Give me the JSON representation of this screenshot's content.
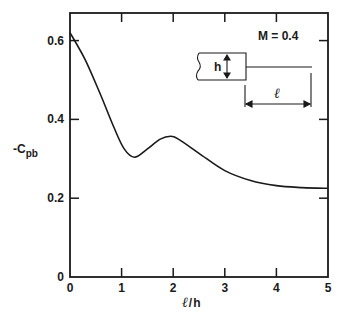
{
  "chart_data": {
    "type": "line",
    "title": "",
    "xlabel": "ℓ/h",
    "ylabel": "-C_pb",
    "ylabel_main": "-C",
    "ylabel_sub": "pb",
    "xlim": [
      0,
      5
    ],
    "ylim": [
      0,
      0.67
    ],
    "x_ticks": [
      0,
      1,
      2,
      3,
      4,
      5
    ],
    "x_tick_labels": [
      "0",
      "1",
      "2",
      "3",
      "4",
      "5"
    ],
    "y_ticks": [
      0,
      0.2,
      0.4,
      0.6
    ],
    "y_tick_labels": [
      "0",
      "0.2",
      "0.4",
      "0.6"
    ],
    "grid": false,
    "legend": null,
    "annotations": [
      "M = 0.4"
    ],
    "inset": {
      "description": "bluff body of height h with splitter plate of length ℓ",
      "height_label": "h",
      "length_label": "ℓ"
    },
    "series": [
      {
        "name": "M = 0.4",
        "x": [
          0,
          0.3,
          0.6,
          0.85,
          1.05,
          1.25,
          1.5,
          1.75,
          1.95,
          2.1,
          2.5,
          3.0,
          3.5,
          4.0,
          4.5,
          5.0
        ],
        "values": [
          0.62,
          0.55,
          0.46,
          0.38,
          0.325,
          0.304,
          0.325,
          0.35,
          0.357,
          0.35,
          0.314,
          0.27,
          0.245,
          0.232,
          0.227,
          0.225
        ]
      }
    ]
  },
  "labels": {
    "mach": "M = 0.4",
    "h": "h",
    "ell": "ℓ",
    "x_axis": "ℓ/h",
    "y_main": "-C",
    "y_sub": "pb"
  },
  "colors": {
    "ink": "#1a1a1a",
    "background": "#ffffff"
  }
}
